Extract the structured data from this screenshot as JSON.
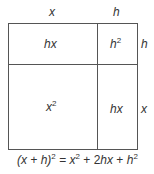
{
  "diagram": {
    "top_labels": {
      "x": "x",
      "h": "h"
    },
    "side_labels": {
      "h": "h",
      "x": "x"
    },
    "regions": {
      "top_left": {
        "base": "hx",
        "exp": ""
      },
      "top_right": {
        "base": "h",
        "exp": "2"
      },
      "bottom_left": {
        "base": "x",
        "exp": "2"
      },
      "bottom_right": {
        "base": "hx",
        "exp": ""
      }
    },
    "formula": {
      "lhs_open": "(x + h)",
      "lhs_exp": "2",
      "eq": " = ",
      "t1": "x",
      "t1_exp": "2",
      "plus1": " + ",
      "t2_coef": "2",
      "t2": "hx",
      "plus2": " + ",
      "t3": "h",
      "t3_exp": "2"
    },
    "line_color": "#555555"
  }
}
